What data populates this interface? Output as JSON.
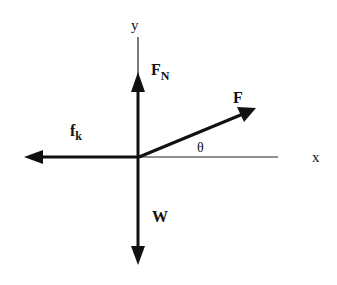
{
  "diagram": {
    "axes": {
      "x_label": "x",
      "y_label": "y"
    },
    "angle_label": "θ",
    "forces": [
      {
        "name": "normal-force",
        "label": "F",
        "subscript": "N",
        "direction": "up"
      },
      {
        "name": "applied-force",
        "label": "F",
        "subscript": "",
        "direction": "up-right at angle θ"
      },
      {
        "name": "kinetic-friction",
        "label": "f",
        "subscript": "k",
        "direction": "left"
      },
      {
        "name": "weight",
        "label": "W",
        "subscript": "",
        "direction": "down"
      }
    ],
    "colors": {
      "ink": "#111111",
      "background": "#ffffff"
    }
  }
}
